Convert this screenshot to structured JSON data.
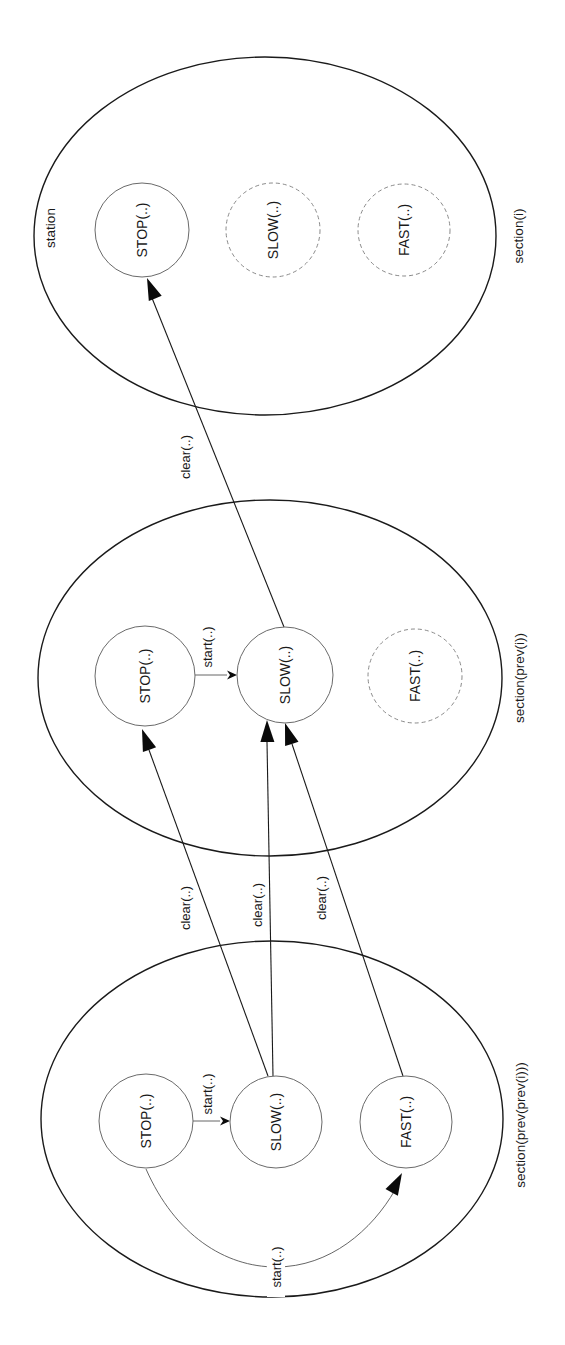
{
  "diagram": {
    "type": "state-transition diagram (rotated 90 degrees)",
    "colors": {
      "background": "#ffffff",
      "ellipse_stroke": "#1a1a1a",
      "active_state_stroke": "#6a6a6a",
      "inactive_state_stroke": "#8a8a8a",
      "edge_stroke": "#1a1a1a",
      "text": "#1a1a1a"
    },
    "text_rotation_deg": -90,
    "sections": [
      {
        "id": "section_i",
        "label": "section(i)",
        "sublabel": "station",
        "ellipse": {
          "cx": 265,
          "cy": 236,
          "rx": 231,
          "ry": 179
        },
        "label_pos": {
          "x": 518,
          "y": 236
        },
        "sublabel_pos": {
          "x": 50,
          "y": 228
        },
        "states": [
          {
            "id": "top_stop",
            "label": "STOP(..)",
            "cx": 142,
            "cy": 230,
            "r": 47,
            "style": "solid"
          },
          {
            "id": "top_slow",
            "label": "SLOW(..)",
            "cx": 273,
            "cy": 230,
            "r": 47,
            "style": "dashed"
          },
          {
            "id": "top_fast",
            "label": "FAST(..)",
            "cx": 404,
            "cy": 230,
            "r": 46,
            "style": "dashed"
          }
        ]
      },
      {
        "id": "section_prev_i",
        "label": "section(prev(i))",
        "sublabel": "",
        "ellipse": {
          "cx": 270,
          "cy": 678,
          "rx": 232,
          "ry": 178
        },
        "label_pos": {
          "x": 519,
          "y": 678
        },
        "states": [
          {
            "id": "mid_stop",
            "label": "STOP(..)",
            "cx": 145,
            "cy": 676,
            "r": 50,
            "style": "solid"
          },
          {
            "id": "mid_slow",
            "label": "SLOW(..)",
            "cx": 285,
            "cy": 675,
            "r": 48,
            "style": "solid"
          },
          {
            "id": "mid_fast",
            "label": "FAST(..)",
            "cx": 415,
            "cy": 676,
            "r": 47,
            "style": "dashed"
          }
        ]
      },
      {
        "id": "section_prev_prev_i",
        "label": "section(prev(prev(i)))",
        "sublabel": "",
        "ellipse": {
          "cx": 272,
          "cy": 1119,
          "rx": 231,
          "ry": 178
        },
        "label_pos": {
          "x": 520,
          "y": 1125
        },
        "states": [
          {
            "id": "bot_stop",
            "label": "STOP(..)",
            "cx": 146,
            "cy": 1121,
            "r": 47,
            "style": "solid"
          },
          {
            "id": "bot_slow",
            "label": "SLOW(..)",
            "cx": 276,
            "cy": 1122,
            "r": 46,
            "style": "solid"
          },
          {
            "id": "bot_fast",
            "label": "FAST(..)",
            "cx": 406,
            "cy": 1122,
            "r": 46,
            "style": "solid"
          }
        ]
      }
    ],
    "edges": [
      {
        "id": "clear_mid_slow_to_top_stop",
        "label": "clear(..)",
        "from": "mid_slow",
        "to": "top_stop",
        "path": "M 284 627 L 152 298",
        "head": {
          "tip_x": 147,
          "tip_y": 278,
          "angle_deg": -112
        },
        "label_pos": {
          "x": 185,
          "y": 457
        },
        "weight": "normal"
      },
      {
        "id": "start_mid_stop_to_mid_slow",
        "label": "start(..)",
        "from": "mid_stop",
        "to": "mid_slow",
        "path": "M 195 675 L 227 675",
        "head": {
          "tip_x": 237,
          "tip_y": 675,
          "angle_deg": 0,
          "small": true
        },
        "label_pos": {
          "x": 207,
          "y": 647
        },
        "weight": "thin"
      },
      {
        "id": "clear_bot_slow_to_mid_stop",
        "label": "clear(..)",
        "from": "bot_slow",
        "to": "mid_stop",
        "path": "M 268 1076 L 149 750",
        "head": {
          "tip_x": 142,
          "tip_y": 729,
          "angle_deg": -110
        },
        "label_pos": {
          "x": 185,
          "y": 908
        },
        "weight": "normal"
      },
      {
        "id": "clear_bot_slow_to_mid_slow",
        "label": "clear(..)",
        "from": "bot_slow",
        "to": "mid_slow",
        "path": "M 273 1076 L 267 742",
        "head": {
          "tip_x": 267,
          "tip_y": 720,
          "angle_deg": -91
        },
        "label_pos": {
          "x": 257,
          "y": 905
        },
        "weight": "normal"
      },
      {
        "id": "clear_bot_fast_to_mid_slow",
        "label": "clear(..)",
        "from": "bot_fast",
        "to": "mid_slow",
        "path": "M 403 1076 L 292 744",
        "head": {
          "tip_x": 285,
          "tip_y": 723,
          "angle_deg": -108
        },
        "label_pos": {
          "x": 321,
          "y": 898
        },
        "weight": "normal"
      },
      {
        "id": "start_bot_stop_to_bot_slow",
        "label": "start(..)",
        "from": "bot_stop",
        "to": "bot_slow",
        "path": "M 193 1121 L 220 1121",
        "head": {
          "tip_x": 230,
          "tip_y": 1121,
          "angle_deg": 0,
          "small": true
        },
        "label_pos": {
          "x": 207,
          "y": 1094
        },
        "weight": "thin"
      },
      {
        "id": "start_bot_stop_to_bot_fast",
        "label": "start(..)",
        "from": "bot_stop",
        "to": "bot_fast",
        "path": "M 146 1169 C 175 1235 225 1267 276 1267 C 330 1267 372 1230 395 1190",
        "head": {
          "tip_x": 402,
          "tip_y": 1173,
          "angle_deg": -62
        },
        "label_pos": {
          "x": 276,
          "y": 1267
        },
        "label_bg": true,
        "weight": "thin"
      }
    ]
  }
}
